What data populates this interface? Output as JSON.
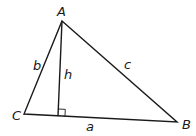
{
  "diagram": {
    "colors": {
      "stroke": "#1a1a1a",
      "background": "#ffffff"
    },
    "vertices": [
      {
        "label": "A",
        "x": 62,
        "y": 21,
        "label_x": 57,
        "label_y": 16
      },
      {
        "label": "B",
        "x": 177,
        "y": 122,
        "label_x": 182,
        "label_y": 129
      },
      {
        "label": "C",
        "x": 24,
        "y": 114,
        "label_x": 12,
        "label_y": 120
      }
    ],
    "sides": [
      {
        "label": "a",
        "from": "C",
        "to": "B",
        "label_x": 86,
        "label_y": 131
      },
      {
        "label": "b",
        "from": "C",
        "to": "A",
        "label_x": 33,
        "label_y": 70
      },
      {
        "label": "c",
        "from": "A",
        "to": "B",
        "label_x": 124,
        "label_y": 69
      }
    ],
    "altitude": {
      "label": "h",
      "from": "A",
      "foot_x": 58,
      "foot_y": 116,
      "label_x": 64,
      "label_y": 79,
      "right_angle_marker": true
    }
  }
}
